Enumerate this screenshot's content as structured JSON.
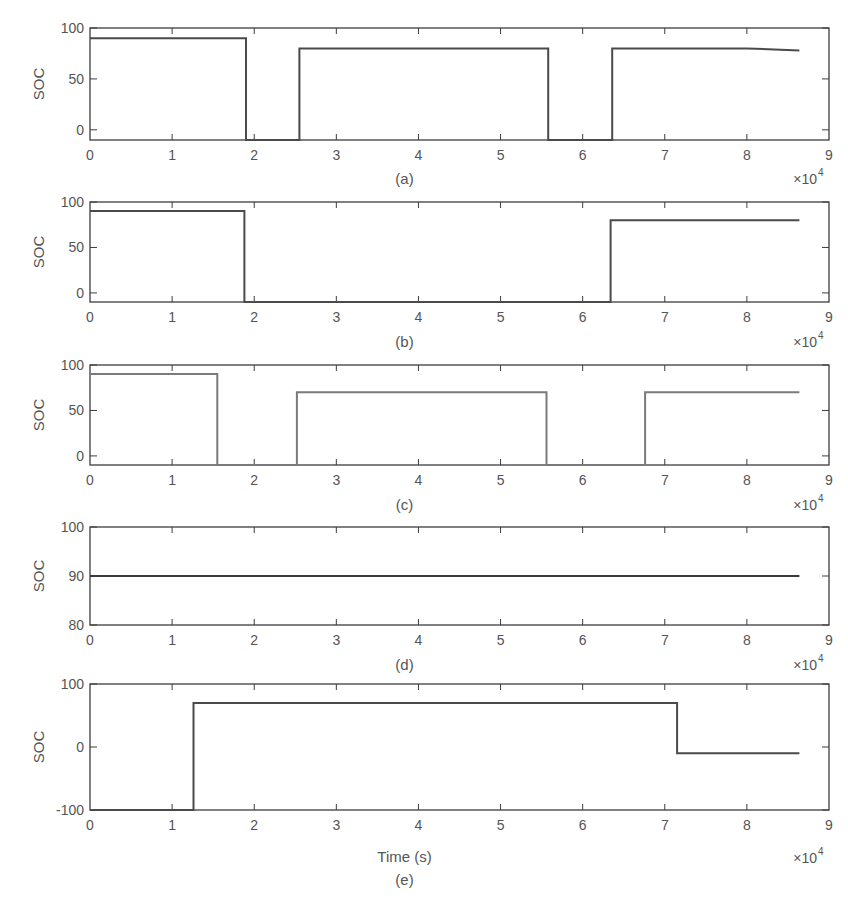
{
  "figure": {
    "x_multiplier_text": "×10",
    "x_multiplier_exp": "4",
    "xlabel": "Time (s)"
  },
  "chart_data": [
    {
      "type": "line",
      "caption": "(a)",
      "ylabel": "SOC",
      "xlabel": "",
      "xlim": [
        0,
        90000
      ],
      "ylim": [
        -10,
        100
      ],
      "xticks": [
        0,
        1,
        2,
        3,
        4,
        5,
        6,
        7,
        8,
        9
      ],
      "xtick_scale": "×10^4",
      "yticks": [
        0,
        50,
        100
      ],
      "grid": false,
      "line_color": "#4a4a4a",
      "x": [
        0,
        19000,
        19000,
        25500,
        25500,
        55800,
        55800,
        63600,
        63600,
        80000,
        86400
      ],
      "y": [
        90,
        90,
        -10,
        -10,
        80,
        80,
        -10,
        -10,
        80,
        80,
        78
      ]
    },
    {
      "type": "line",
      "caption": "(b)",
      "ylabel": "SOC",
      "xlabel": "",
      "xlim": [
        0,
        90000
      ],
      "ylim": [
        -10,
        100
      ],
      "xticks": [
        0,
        1,
        2,
        3,
        4,
        5,
        6,
        7,
        8,
        9
      ],
      "xtick_scale": "×10^4",
      "yticks": [
        0,
        50,
        100
      ],
      "grid": false,
      "line_color": "#4a4a4a",
      "x": [
        0,
        18800,
        18800,
        63400,
        63400,
        86400
      ],
      "y": [
        90,
        90,
        -10,
        -10,
        80,
        80
      ]
    },
    {
      "type": "line",
      "caption": "(c)",
      "ylabel": "SOC",
      "xlabel": "",
      "xlim": [
        0,
        90000
      ],
      "ylim": [
        -10,
        100
      ],
      "xticks": [
        0,
        1,
        2,
        3,
        4,
        5,
        6,
        7,
        8,
        9
      ],
      "xtick_scale": "×10^4",
      "yticks": [
        0,
        50,
        100
      ],
      "grid": false,
      "line_color": "#7a7a7a",
      "x": [
        0,
        15500,
        15500,
        25200,
        25200,
        55600,
        55600,
        67600,
        67600,
        86400
      ],
      "y": [
        90,
        90,
        -10,
        -10,
        70,
        70,
        -10,
        -10,
        70,
        70
      ]
    },
    {
      "type": "line",
      "caption": "(d)",
      "ylabel": "SOC",
      "xlabel": "",
      "xlim": [
        0,
        90000
      ],
      "ylim": [
        80,
        100
      ],
      "xticks": [
        0,
        1,
        2,
        3,
        4,
        5,
        6,
        7,
        8,
        9
      ],
      "xtick_scale": "×10^4",
      "yticks": [
        80,
        90,
        100
      ],
      "grid": false,
      "line_color": "#3a3a3a",
      "x": [
        0,
        86400
      ],
      "y": [
        90,
        90
      ]
    },
    {
      "type": "line",
      "caption": "(e)",
      "ylabel": "SOC",
      "xlabel": "Time (s)",
      "xlim": [
        0,
        90000
      ],
      "ylim": [
        -100,
        100
      ],
      "xticks": [
        0,
        1,
        2,
        3,
        4,
        5,
        6,
        7,
        8,
        9
      ],
      "xtick_scale": "×10^4",
      "yticks": [
        -100,
        0,
        100
      ],
      "grid": false,
      "line_color": "#4a4a4a",
      "x": [
        0,
        12600,
        12600,
        71500,
        71500,
        86400
      ],
      "y": [
        -100,
        -100,
        70,
        70,
        -10,
        -10
      ]
    }
  ],
  "layout": {
    "x_left": 90,
    "x_right": 829,
    "panels": [
      {
        "top": 28,
        "bottom": 140,
        "caption_y": 184,
        "mult_y": 184
      },
      {
        "top": 202,
        "bottom": 302,
        "caption_y": 347,
        "mult_y": 347
      },
      {
        "top": 365,
        "bottom": 465,
        "caption_y": 510,
        "mult_y": 510
      },
      {
        "top": 527,
        "bottom": 625,
        "caption_y": 670,
        "mult_y": 670
      },
      {
        "top": 684,
        "bottom": 810,
        "caption_y": 885,
        "mult_y": 863,
        "xlabel_y": 862
      }
    ]
  }
}
